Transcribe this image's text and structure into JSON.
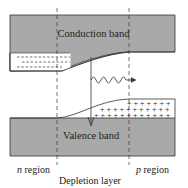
{
  "diagram": {
    "labels": {
      "conduction_band": "Conduction band",
      "valence_band": "Valence band",
      "n_region_italic": "n",
      "n_region_rest": " region",
      "p_region_italic": "p",
      "p_region_rest": " region",
      "depletion_layer": "Depletion layer"
    },
    "colors": {
      "band_fill": "#a9a9a9",
      "line": "#333333",
      "background": "#ffffff"
    },
    "carriers": {
      "electrons_symbol": "-",
      "holes_symbol": "+"
    }
  }
}
